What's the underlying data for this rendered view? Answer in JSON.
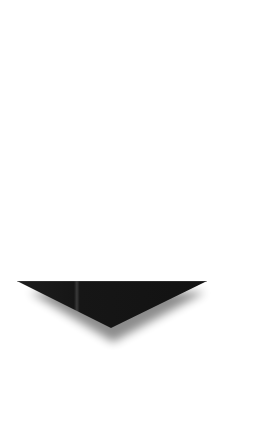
{
  "canvas": {
    "width": 261,
    "height": 430,
    "background": "#ffffff"
  },
  "arrow": {
    "icon": "down-triangle-icon",
    "direction": "down",
    "fill_color": "#1a1a1a",
    "highlight_color": "#3a3a3a",
    "shadow_color": "#000000",
    "points": {
      "top_left": [
        17,
        281
      ],
      "top_right": [
        207,
        281
      ],
      "tip": [
        111,
        328
      ]
    }
  }
}
